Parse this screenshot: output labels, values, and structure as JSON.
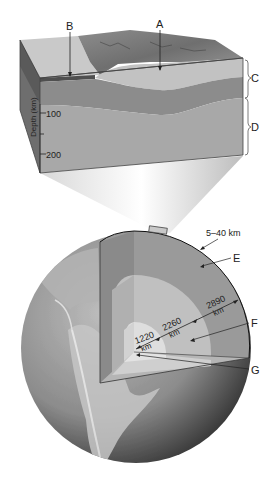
{
  "block": {
    "label_A": "A",
    "label_B": "B",
    "label_C": "C",
    "label_D": "D",
    "axis_title": "Depth (km)",
    "ticks": [
      "100",
      "200"
    ]
  },
  "globe": {
    "crust_thickness": "5–40 km",
    "label_E": "E",
    "label_F": "F",
    "label_G": "G",
    "mantle_depth": "2890",
    "outer_core_thickness": "2260",
    "inner_core_radius": "1220",
    "unit": "km"
  },
  "colors": {
    "lithosphere": "#8a8a8a",
    "asthenosphere": "#a9a9a9",
    "continental_crust": "#c4c4c4",
    "oceanic_crust": "#5e5e5e",
    "mantle": "#9d9d9d",
    "outer_core": "#c2c2c2",
    "inner_core": "#dedede"
  }
}
